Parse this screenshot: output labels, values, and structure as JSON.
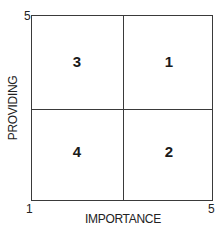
{
  "diagram": {
    "x_axis": {
      "label": "IMPORTANCE",
      "min": "1",
      "max": "5"
    },
    "y_axis": {
      "label": "PROVIDING",
      "min": "1",
      "max": "5"
    },
    "quadrants": {
      "top_left": "3",
      "top_right": "1",
      "bottom_left": "4",
      "bottom_right": "2"
    }
  }
}
